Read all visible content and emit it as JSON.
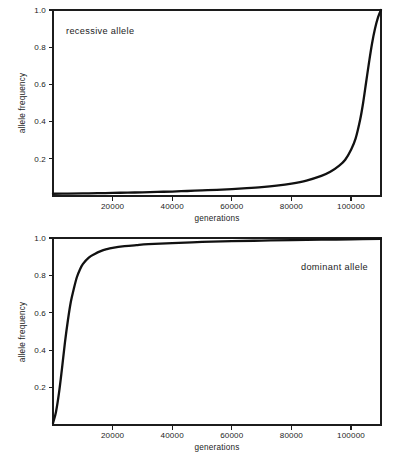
{
  "figure": {
    "background": "#ffffff",
    "ink": "#111111"
  },
  "chart_data": [
    {
      "type": "line",
      "title": "",
      "annotation": "recessive allele",
      "annotation_position": "top-left",
      "xlabel": "generations",
      "ylabel": "allele frequency",
      "xlim": [
        0,
        110000
      ],
      "ylim": [
        0,
        1.0
      ],
      "xticks": [
        20000,
        40000,
        60000,
        80000,
        100000
      ],
      "xtick_labels": [
        "20000",
        "40000",
        "60000",
        "80000",
        "100000"
      ],
      "yticks": [
        0.2,
        0.4,
        0.6,
        0.8,
        1.0
      ],
      "ytick_labels": [
        "0.2",
        "0.4",
        "0.6",
        "0.8",
        "1.0"
      ],
      "grid": false,
      "legend": "none",
      "series": [
        {
          "name": "recessive allele frequency",
          "x": [
            0,
            5000,
            10000,
            15000,
            20000,
            25000,
            30000,
            35000,
            40000,
            45000,
            50000,
            55000,
            60000,
            65000,
            70000,
            75000,
            80000,
            85000,
            90000,
            93000,
            96000,
            98000,
            100000,
            101500,
            103000,
            104000,
            105000,
            106000,
            107000,
            108000,
            109000,
            110000
          ],
          "y": [
            0.012,
            0.013,
            0.014,
            0.015,
            0.017,
            0.018,
            0.02,
            0.022,
            0.024,
            0.027,
            0.03,
            0.033,
            0.037,
            0.042,
            0.048,
            0.056,
            0.067,
            0.083,
            0.108,
            0.13,
            0.163,
            0.195,
            0.25,
            0.31,
            0.41,
            0.5,
            0.61,
            0.72,
            0.82,
            0.9,
            0.96,
            1.0
          ]
        }
      ]
    },
    {
      "type": "line",
      "title": "",
      "annotation": "dominant allele",
      "annotation_position": "top-right",
      "xlabel": "generations",
      "ylabel": "allele frequency",
      "xlim": [
        0,
        110000
      ],
      "ylim": [
        0,
        1.0
      ],
      "xticks": [
        20000,
        40000,
        60000,
        80000,
        100000
      ],
      "xtick_labels": [
        "20000",
        "40000",
        "60000",
        "80000",
        "100000"
      ],
      "yticks": [
        0.2,
        0.4,
        0.6,
        0.8,
        1.0
      ],
      "ytick_labels": [
        "0.2",
        "0.4",
        "0.6",
        "0.8",
        "1.0"
      ],
      "grid": false,
      "legend": "none",
      "series": [
        {
          "name": "dominant allele frequency",
          "x": [
            0,
            1000,
            2000,
            3000,
            4000,
            5000,
            6000,
            7000,
            8000,
            9000,
            10000,
            12000,
            14000,
            16000,
            18000,
            20000,
            24000,
            28000,
            32000,
            40000,
            50000,
            60000,
            70000,
            80000,
            90000,
            100000,
            110000
          ],
          "y": [
            0.01,
            0.07,
            0.17,
            0.3,
            0.44,
            0.56,
            0.66,
            0.73,
            0.79,
            0.83,
            0.86,
            0.895,
            0.915,
            0.93,
            0.94,
            0.947,
            0.956,
            0.962,
            0.967,
            0.973,
            0.979,
            0.983,
            0.986,
            0.989,
            0.991,
            0.993,
            0.995
          ]
        }
      ]
    }
  ]
}
